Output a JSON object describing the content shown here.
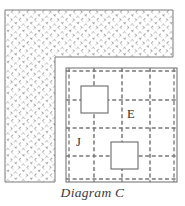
{
  "figure": {
    "caption": "Diagram C",
    "canvas": {
      "width": 185,
      "height": 206,
      "background": "#ffffff"
    },
    "colors": {
      "outline": "#6b6b6b",
      "grid_dash": "#787878",
      "hatch": "#9a9a9a",
      "text": "#2e2e2e",
      "caption_text": "#3a3a3a",
      "fill": "#ffffff"
    },
    "hatched_region": {
      "name": "L-shaped hatched mass",
      "pattern": "diagonal-crosshatch-dashed",
      "segments": [
        {
          "name": "top-band",
          "x": 5,
          "y": 10,
          "width": 168,
          "height": 47
        },
        {
          "name": "left-column",
          "x": 5,
          "y": 10,
          "width": 50,
          "height": 172
        }
      ]
    },
    "grid": {
      "name": "dashed-module-grid",
      "x": 66,
      "y": 68,
      "width": 111,
      "height": 114,
      "columns": 4,
      "rows": 4,
      "x_lines": [
        66,
        94,
        122,
        150,
        177
      ],
      "y_lines": [
        68,
        100,
        128,
        156,
        182
      ],
      "border_style": "solid",
      "interior_style": "dashed"
    },
    "blocks": [
      {
        "name": "block-upper-left",
        "x": 81,
        "y": 86,
        "size": 27
      },
      {
        "name": "block-lower-middle",
        "x": 111,
        "y": 142,
        "size": 27
      }
    ],
    "labels": [
      {
        "name": "label-E",
        "text": "E",
        "x": 127,
        "y": 108
      },
      {
        "name": "label-J",
        "text": "J",
        "x": 76,
        "y": 136
      }
    ]
  }
}
